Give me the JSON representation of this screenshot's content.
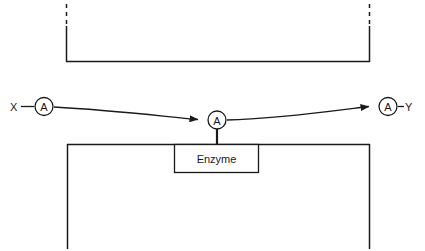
{
  "diagram": {
    "background_color": "#ffffff",
    "stroke_color": "#1a1a1a",
    "terminals": {
      "input_label": "X",
      "output_label": "Y"
    },
    "nodes": [
      {
        "id": "node-left",
        "label": "A",
        "cx": 44,
        "cy": 106,
        "r": 9
      },
      {
        "id": "node-center",
        "label": "A",
        "cx": 217,
        "cy": 120,
        "r": 9
      },
      {
        "id": "node-right",
        "label": "A",
        "cx": 388,
        "cy": 106,
        "r": 9
      }
    ],
    "enzyme_box": {
      "label": "Enzyme",
      "x": 174,
      "y": 144,
      "width": 84,
      "height": 28
    },
    "top_bracket": {
      "left_x": 66,
      "right_x": 370,
      "baseline_y": 62,
      "dash_top_y": 4,
      "dash_end_y": 26,
      "dash_pattern": "4 4"
    },
    "bottom_bracket": {
      "left_x": 67,
      "right_x": 370,
      "top_y": 144,
      "bottom_y": 249
    },
    "connectors": [
      {
        "id": "x-to-left",
        "from": "X",
        "to": "node-left",
        "arrow": false
      },
      {
        "id": "left-to-center",
        "from": "node-left",
        "to": "node-center",
        "arrow": true
      },
      {
        "id": "center-to-right",
        "from": "node-center",
        "to": "node-right",
        "arrow": true
      },
      {
        "id": "right-to-y",
        "from": "node-right",
        "to": "Y",
        "arrow": false
      },
      {
        "id": "center-to-enzyme",
        "from": "node-center",
        "to": "enzyme_box",
        "arrow": false
      }
    ]
  }
}
